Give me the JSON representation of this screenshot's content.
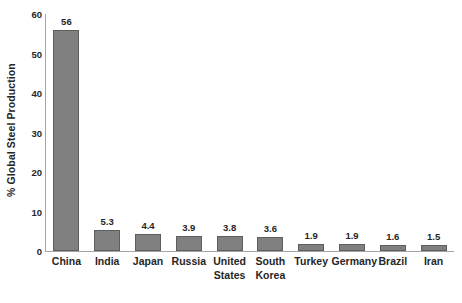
{
  "chart_data": {
    "type": "bar",
    "title": "",
    "subtitle": "",
    "xlabel": "",
    "ylabel": "% Global Steel Production",
    "categories": [
      "China",
      "India",
      "Japan",
      "Russia",
      "United States",
      "South Korea",
      "Turkey",
      "Germany",
      "Brazil",
      "Iran"
    ],
    "values": [
      56,
      5.3,
      4.4,
      3.9,
      3.8,
      3.6,
      1.9,
      1.9,
      1.6,
      1.5
    ],
    "value_labels": [
      "56",
      "5.3",
      "4.4",
      "3.9",
      "3.8",
      "3.6",
      "1.9",
      "1.9",
      "1.6",
      "1.5"
    ],
    "ylim": [
      0,
      60
    ],
    "ytick_values": [
      0,
      10,
      20,
      30,
      40,
      50,
      60
    ],
    "ytick_labels": [
      "0",
      "10",
      "20",
      "30",
      "40",
      "50",
      "60"
    ],
    "grid": false,
    "legend": false,
    "legend_position": "none",
    "bar_color": "#808080",
    "bar_border_color": "#5E5E5E",
    "axis_color": "#A6A6A6",
    "text_color": "#262626",
    "background_color": "#FFFFFF",
    "data_labels_shown": true
  }
}
